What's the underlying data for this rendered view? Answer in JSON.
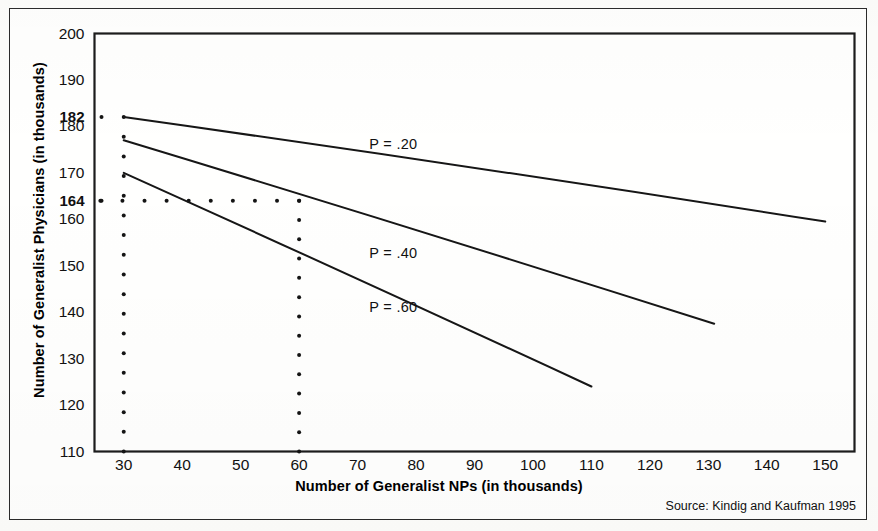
{
  "figure": {
    "source_note": "Source: Kindig and Kaufman 1995"
  },
  "chart_data": {
    "type": "line",
    "title": "",
    "xlabel": "Number of Generalist NPs (in thousands)",
    "ylabel": "Number of Generalist Physicians (in thousands)",
    "xlim": [
      25,
      155
    ],
    "ylim": [
      110,
      200
    ],
    "grid": false,
    "legend_position": "inline-right-of-curve",
    "xticks": [
      30,
      40,
      50,
      60,
      70,
      80,
      90,
      100,
      110,
      120,
      130,
      140,
      150
    ],
    "yticks": [
      110,
      120,
      130,
      140,
      150,
      160,
      164,
      170,
      180,
      182,
      190,
      200
    ],
    "ytick_labels": [
      "110",
      "120",
      "130",
      "140",
      "150",
      "160",
      "164",
      "170",
      "180",
      "182",
      "190",
      "200"
    ],
    "emphasized_yticks": [
      164,
      182
    ],
    "series": [
      {
        "name": "P = .20",
        "label": "P = .20",
        "x": [
          30,
          150
        ],
        "y": [
          182,
          159.5
        ],
        "label_x": 72,
        "label_y": 176
      },
      {
        "name": "P = .40",
        "label": "P = .40",
        "x": [
          30,
          131
        ],
        "y": [
          177,
          137.5
        ],
        "label_x": 72,
        "label_y": 152.5
      },
      {
        "name": "P = .60",
        "label": "P = .60",
        "x": [
          30,
          110
        ],
        "y": [
          170,
          124
        ],
        "label_x": 72,
        "label_y": 141
      }
    ],
    "reference_lines": [
      {
        "name": "vertical-30",
        "orientation": "vertical",
        "value": 30,
        "style": "dotted",
        "from": 110,
        "to": 182
      },
      {
        "name": "vertical-60",
        "orientation": "vertical",
        "value": 60,
        "style": "dotted",
        "from": 110,
        "to": 164
      },
      {
        "name": "horizontal-164",
        "orientation": "horizontal",
        "value": 164,
        "style": "dotted",
        "from": 26,
        "to": 60
      }
    ]
  },
  "axis": {
    "x_label": "Number of Generalist NPs (in thousands)",
    "y_label": "Number of Generalist Physicians (in thousands)"
  }
}
